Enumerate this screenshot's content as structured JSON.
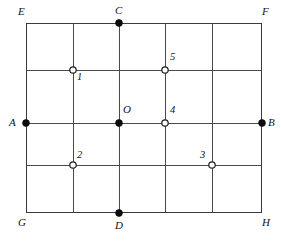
{
  "figure": {
    "background_color": "#ffffff",
    "line_color": "#4a4a4a",
    "border_color": "#3a3a3a",
    "filled_marker_color": "#0c0c0c",
    "hollow_marker_fill": "#ffffff",
    "hollow_marker_stroke": "#1a1a1a"
  },
  "geometry": {
    "rect": {
      "left": 26,
      "top": 23,
      "right": 262,
      "bottom": 213
    },
    "vertical_lines_x": [
      26,
      73,
      119,
      165,
      212,
      262
    ],
    "horizontal_lines_y": [
      23,
      70,
      123,
      165,
      213
    ],
    "columns": 5,
    "rows": 4
  },
  "corner_labels": [
    {
      "text": "E",
      "x": 18,
      "y": 6,
      "name": "corner-label-e"
    },
    {
      "text": "F",
      "x": 262,
      "y": 6,
      "name": "corner-label-f"
    },
    {
      "text": "G",
      "x": 18,
      "y": 217,
      "name": "corner-label-g"
    },
    {
      "text": "H",
      "x": 262,
      "y": 217,
      "name": "corner-label-h"
    }
  ],
  "axis_endpoints": [
    {
      "id": "A",
      "label": "A",
      "cx": 26,
      "cy": 123,
      "marker": "filled",
      "label_x": 9,
      "label_y": 117,
      "name": "point-a"
    },
    {
      "id": "B",
      "label": "B",
      "cx": 262,
      "cy": 123,
      "marker": "filled",
      "label_x": 268,
      "label_y": 117,
      "name": "point-b"
    },
    {
      "id": "C",
      "label": "C",
      "cx": 119,
      "cy": 23,
      "marker": "filled",
      "label_x": 115,
      "label_y": 5,
      "name": "point-c"
    },
    {
      "id": "D",
      "label": "D",
      "cx": 119,
      "cy": 213,
      "marker": "filled",
      "label_x": 115,
      "label_y": 220,
      "name": "point-d"
    },
    {
      "id": "O",
      "label": "O",
      "cx": 119,
      "cy": 123,
      "marker": "filled",
      "label_x": 123,
      "label_y": 104,
      "name": "point-o"
    }
  ],
  "numbered_points": [
    {
      "id": "1",
      "label": "1",
      "cx": 73,
      "cy": 70,
      "marker": "hollow",
      "label_x": 77,
      "label_y": 72,
      "name": "point-1"
    },
    {
      "id": "2",
      "label": "2",
      "cx": 73,
      "cy": 165,
      "marker": "hollow",
      "label_x": 77,
      "label_y": 150,
      "name": "point-2"
    },
    {
      "id": "3",
      "label": "3",
      "cx": 212,
      "cy": 165,
      "marker": "hollow",
      "label_x": 200,
      "label_y": 150,
      "name": "point-3"
    },
    {
      "id": "4",
      "label": "4",
      "cx": 165,
      "cy": 123,
      "marker": "hollow",
      "label_x": 170,
      "label_y": 105,
      "name": "point-4"
    },
    {
      "id": "5",
      "label": "5",
      "cx": 165,
      "cy": 70,
      "marker": "hollow",
      "label_x": 170,
      "label_y": 52,
      "name": "point-5"
    }
  ],
  "marker_radii": {
    "filled": 3.4,
    "hollow": 3.2
  }
}
